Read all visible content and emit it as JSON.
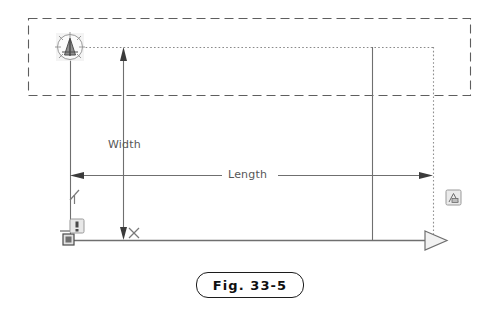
{
  "figure": {
    "caption": "Fig. 33-5",
    "type": "cad-drawing-annotation"
  },
  "labels": {
    "width": "Width",
    "length": "Length",
    "axis_y": "Y",
    "axis_x": "X"
  },
  "icons": {
    "ucs_north_arrow": "ucs-north-arrow-icon",
    "origin_marker": "origin-marker-icon",
    "warning_badge": "warning-badge-icon",
    "object_badge": "object-snap-badge-icon",
    "length_arrow_left": "arrowhead-left-icon",
    "length_arrow_right": "arrowhead-right-icon",
    "width_arrow_top": "arrowhead-up-icon",
    "width_arrow_bottom": "arrowhead-down-icon",
    "baseline_arrow": "large-open-arrowhead-icon"
  },
  "colors": {
    "line": "#6f6f6f",
    "dashed_selection": "#5e5e5e",
    "dotted_guide": "#8a8a8a",
    "text": "#575757",
    "caption_border": "#1c1c1c",
    "caption_text": "#101010",
    "arrow_fill": "#3b3b3b",
    "badge_fill": "#e6e6e6",
    "badge_stroke": "#9a9a9a"
  },
  "geometry": {
    "selection_box": {
      "x": 28,
      "y": 18,
      "width": 442,
      "height": 77
    },
    "width_dimension": {
      "x": 123,
      "y1": 47,
      "y2": 240
    },
    "length_dimension": {
      "y": 175,
      "x1": 70,
      "x2": 433
    },
    "baseline": {
      "y": 240,
      "x1": 64,
      "x2": 443
    },
    "vertical_left": {
      "x": 70,
      "y1": 47,
      "y2": 240
    },
    "vertical_mid": {
      "x": 372,
      "y1": 47,
      "y2": 240
    },
    "vertical_right_dotted": {
      "x": 433,
      "y1": 47,
      "y2": 240
    },
    "guide_horizontal_dotted": {
      "y": 47,
      "x1": 78,
      "x2": 433
    }
  }
}
